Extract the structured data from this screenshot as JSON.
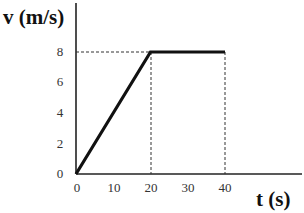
{
  "chart_data": {
    "type": "line",
    "title": "",
    "xlabel": "t (s)",
    "ylabel": "v (m/s)",
    "x_ticks": [
      0,
      10,
      20,
      30,
      40
    ],
    "y_ticks": [
      0,
      2,
      4,
      6,
      8
    ],
    "xlim": [
      0,
      60
    ],
    "ylim": [
      0,
      11
    ],
    "grid": false,
    "legend": null,
    "series": [
      {
        "name": "velocity",
        "x": [
          0,
          20,
          40
        ],
        "y": [
          0,
          8,
          8
        ]
      }
    ],
    "reference_lines": [
      {
        "type": "horizontal-dashed",
        "y": 8,
        "from_x": 0,
        "to_x": 40
      },
      {
        "type": "vertical-dashed",
        "x": 20,
        "from_y": 0,
        "to_y": 8
      },
      {
        "type": "vertical-dashed",
        "x": 40,
        "from_y": 0,
        "to_y": 8
      }
    ]
  },
  "labels": {
    "x_axis": "t (s)",
    "y_axis": "v (m/s)",
    "x_ticks": [
      "0",
      "10",
      "20",
      "30",
      "40"
    ],
    "y_ticks": [
      "0",
      "2",
      "4",
      "6",
      "8"
    ]
  }
}
